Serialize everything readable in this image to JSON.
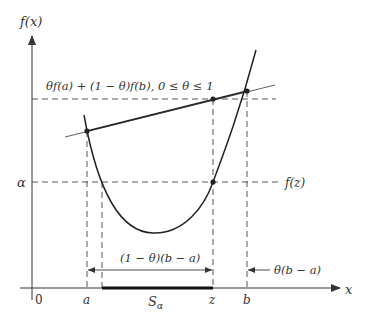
{
  "diagram": {
    "axes": {
      "y_label": "f(x)",
      "x_label": "x",
      "origin_label": "0"
    },
    "x_ticks": {
      "a": "a",
      "z": "z",
      "b": "b"
    },
    "levels": {
      "alpha": "α",
      "fz": "f(z)",
      "chord_label": "θf(a) + (1 − θ)f(b),  0 ≤ θ ≤ 1"
    },
    "intervals": {
      "left_span": "(1 − θ)(b − a)",
      "right_span": "θ(b − a)",
      "sublevel_set": "S",
      "sublevel_sub": "α"
    },
    "colors": {
      "stroke": "#333333",
      "dashed": "#555555",
      "background": "#ffffff"
    }
  }
}
